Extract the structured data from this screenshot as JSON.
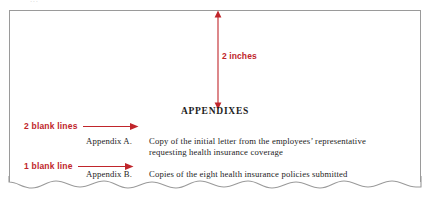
{
  "figure": {
    "name": "appendixes-page-layout",
    "cropped_top_line": "...",
    "colors": {
      "annotation_red": "#c0252b",
      "page_border_gray": "#9a9a9a",
      "body_text": "#1d1d1d",
      "page_background": "#ffffff"
    }
  },
  "measurement": {
    "label": "2 inches",
    "arrow_name": "vertical-double-arrow"
  },
  "page": {
    "heading": "APPENDIXES"
  },
  "callouts": [
    {
      "label": "2 blank lines",
      "arrow_name": "right-arrow",
      "points_to": "appendix-a-entry"
    },
    {
      "label": "1 blank line",
      "arrow_name": "right-arrow",
      "points_to": "appendix-b-entry"
    }
  ],
  "appendixes": [
    {
      "label": "Appendix A.",
      "description": "Copy of the initial letter from the employees’ representative requesting health insurance coverage"
    },
    {
      "label": "Appendix B.",
      "description": "Copies of the eight health insurance policies submitted"
    }
  ]
}
